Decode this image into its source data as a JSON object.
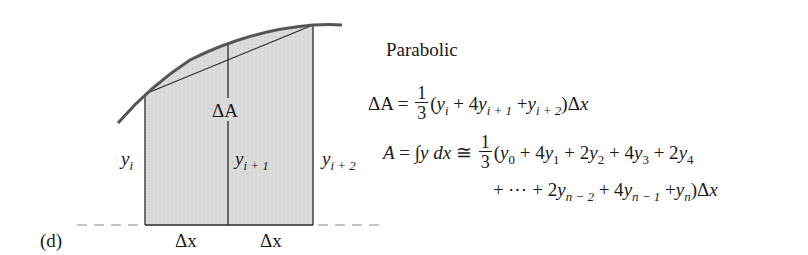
{
  "figure": {
    "panel_label": "(d)",
    "method_title": "Parabolic",
    "diagram": {
      "labels": {
        "delta_area": "ΔA",
        "y_left": {
          "base": "y",
          "sub": "i"
        },
        "y_mid": {
          "base": "y",
          "sub": "i + 1"
        },
        "y_right": {
          "base": "y",
          "sub": "i + 2"
        },
        "dx_left": "Δx",
        "dx_right": "Δx"
      },
      "colors": {
        "fill": "#d9d9d9",
        "curve": "#555555",
        "lines": "#2a2a2a",
        "dash": "#888888"
      }
    },
    "equations": {
      "eq1": {
        "lhs": "ΔA",
        "equals": "=",
        "frac_num": "1",
        "frac_den": "3",
        "body_open": "(",
        "t1_base": "y",
        "t1_sub": "i",
        "plus1": " + 4",
        "t2_base": "y",
        "t2_sub": "i + 1",
        "plus2": " +",
        "t3_base": "y",
        "t3_sub": "i + 2",
        "close": ")Δ",
        "dx_var": "x"
      },
      "eq2": {
        "lhs": "A",
        "equals": "=",
        "integral": "∫",
        "integrand": "y dx",
        "approx": "≅",
        "frac_num": "1",
        "frac_den": "3",
        "open": "(",
        "terms": [
          {
            "coef": "",
            "base": "y",
            "sub": "0"
          },
          {
            "coef": " + 4",
            "base": "y",
            "sub": "1"
          },
          {
            "coef": " + 2",
            "base": "y",
            "sub": "2"
          },
          {
            "coef": " + 4",
            "base": "y",
            "sub": "3"
          },
          {
            "coef": " + 2",
            "base": "y",
            "sub": "4"
          }
        ]
      },
      "eq3": {
        "lead": "+ ⋯ + 2",
        "t1_base": "y",
        "t1_sub": "n − 2",
        "plus1": " + 4",
        "t2_base": "y",
        "t2_sub": "n − 1",
        "plus2": " +",
        "t3_base": "y",
        "t3_sub": "n",
        "close": ")Δ",
        "dx_var": "x"
      }
    }
  }
}
